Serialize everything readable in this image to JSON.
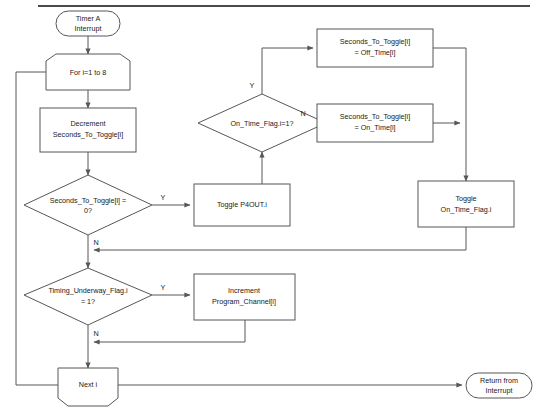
{
  "diagram": {
    "type": "flowchart",
    "stroke_color": "#575757",
    "fill_color": "#ffffff",
    "text_color": "#1a1a1a",
    "rule_color": "#4a4a4a"
  },
  "nodes": {
    "start": {
      "shape": "terminator",
      "line1": "Timer A",
      "line2": "Interrupt"
    },
    "for_loop": {
      "shape": "loop-start",
      "line1": "For i=1 to 8"
    },
    "decrement": {
      "shape": "process",
      "line1": "Decrement",
      "line2": "Seconds_To_Toggle[i]"
    },
    "seconds_zero": {
      "shape": "decision",
      "line1": "Seconds_To_Toggle[i] =",
      "line2": "0?"
    },
    "toggle_p4out": {
      "shape": "process",
      "line1": "Toggle P4OUT.i"
    },
    "on_time_flag": {
      "shape": "decision",
      "line1": "On_Time_Flag.i=1?"
    },
    "set_off_time": {
      "shape": "process",
      "line1": "Seconds_To_Toggle[i]",
      "line2": "= Off_Time[i]"
    },
    "set_on_time": {
      "shape": "process",
      "line1": "Seconds_To_Toggle[i]",
      "line2": "= On_Time[i]"
    },
    "toggle_flag": {
      "shape": "process",
      "line1": "Toggle",
      "line2": "On_Time_Flag.i"
    },
    "timing_underway": {
      "shape": "decision",
      "line1": "Timing_Underway_Flag.i",
      "line2": "= 1?"
    },
    "increment_channel": {
      "shape": "process",
      "line1": "Increment",
      "line2": "Program_Channel[i]"
    },
    "next_i": {
      "shape": "loop-end",
      "line1": "Next i"
    },
    "return": {
      "shape": "terminator",
      "line1": "Return from",
      "line2": "Interrupt"
    }
  },
  "branch_labels": {
    "seconds_zero_yes": "Y",
    "seconds_zero_no": "N",
    "on_time_flag_yes": "Y",
    "on_time_flag_no": "N",
    "timing_underway_yes": "Y",
    "timing_underway_no": "N"
  }
}
